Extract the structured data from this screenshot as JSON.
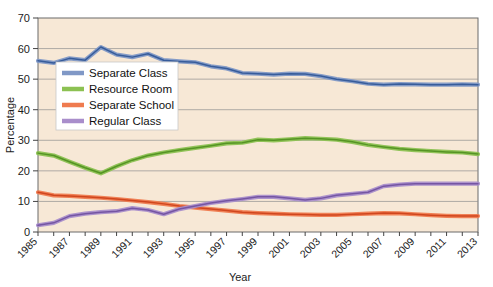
{
  "chart_data": {
    "type": "line",
    "title": "",
    "xlabel": "Year",
    "ylabel": "Percentage",
    "ylim": [
      0,
      70
    ],
    "yticks": [
      0,
      10,
      20,
      30,
      40,
      50,
      60,
      70
    ],
    "grid": true,
    "legend_position": "upper-left-inside",
    "x": [
      1985,
      1986,
      1987,
      1988,
      1989,
      1990,
      1991,
      1992,
      1993,
      1994,
      1995,
      1996,
      1997,
      1998,
      1999,
      2000,
      2001,
      2002,
      2003,
      2004,
      2005,
      2006,
      2007,
      2008,
      2009,
      2010,
      2011,
      2012,
      2013
    ],
    "xtick_labels": [
      "1985",
      "1987",
      "1989",
      "1991",
      "1993",
      "1995",
      "1997",
      "1999",
      "2001",
      "2003",
      "2005",
      "2007",
      "2009",
      "2011",
      "2013"
    ],
    "xtick_values": [
      1985,
      1987,
      1989,
      1991,
      1993,
      1995,
      1997,
      1999,
      2001,
      2003,
      2005,
      2007,
      2009,
      2011,
      2013
    ],
    "series": [
      {
        "name": "Separate Class",
        "color": "#8098c6",
        "core_color": "#2f5596",
        "values": [
          56.0,
          55.3,
          56.8,
          56.2,
          60.5,
          58.0,
          57.2,
          58.3,
          56.2,
          55.8,
          55.5,
          54.2,
          53.5,
          52.0,
          51.8,
          51.5,
          51.8,
          51.7,
          51.0,
          50.0,
          49.3,
          48.5,
          48.2,
          48.4,
          48.3,
          48.2,
          48.2,
          48.3,
          48.2
        ]
      },
      {
        "name": "Resource Room",
        "color": "#8cc152",
        "core_color": "#4f8f1e",
        "values": [
          25.8,
          25.0,
          23.0,
          21.0,
          19.2,
          21.5,
          23.5,
          25.0,
          26.0,
          26.8,
          27.5,
          28.2,
          29.0,
          29.2,
          30.2,
          30.0,
          30.3,
          30.7,
          30.5,
          30.2,
          29.5,
          28.5,
          27.8,
          27.2,
          26.8,
          26.5,
          26.2,
          26.0,
          25.5
        ]
      },
      {
        "name": "Separate School",
        "color": "#ef7b4f",
        "core_color": "#cc3f18",
        "values": [
          13.0,
          12.0,
          11.8,
          11.5,
          11.2,
          10.8,
          10.3,
          9.8,
          9.2,
          8.5,
          8.0,
          7.5,
          7.0,
          6.5,
          6.2,
          6.0,
          5.8,
          5.7,
          5.6,
          5.6,
          5.8,
          6.0,
          6.2,
          6.1,
          5.8,
          5.5,
          5.3,
          5.2,
          5.2
        ]
      },
      {
        "name": "Regular Class",
        "color": "#a98ecb",
        "core_color": "#6f4f9e",
        "values": [
          2.2,
          3.0,
          5.2,
          6.0,
          6.5,
          6.8,
          7.8,
          7.2,
          5.8,
          7.5,
          8.5,
          9.5,
          10.2,
          10.8,
          11.5,
          11.5,
          11.0,
          10.5,
          11.0,
          12.0,
          12.5,
          13.0,
          15.0,
          15.5,
          15.8,
          15.8,
          15.8,
          15.8,
          15.8
        ]
      }
    ]
  }
}
